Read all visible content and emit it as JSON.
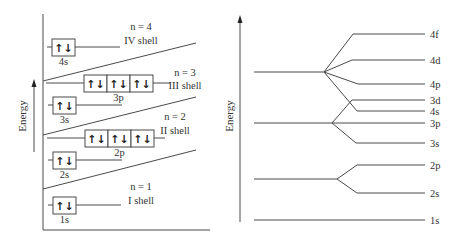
{
  "left_diagram": {
    "axis_label": "Energy",
    "shells": [
      {
        "n_label": "n = 4",
        "shell_label": "IV shell"
      },
      {
        "n_label": "n = 3",
        "shell_label": "III shell"
      },
      {
        "n_label": "n = 2",
        "shell_label": "II shell"
      },
      {
        "n_label": "n = 1",
        "shell_label": "I shell"
      }
    ],
    "orbitals": [
      {
        "label": "4s",
        "boxes": 1
      },
      {
        "label": "3p",
        "boxes": 3
      },
      {
        "label": "3s",
        "boxes": 1
      },
      {
        "label": "2p",
        "boxes": 3
      },
      {
        "label": "2s",
        "boxes": 1
      },
      {
        "label": "1s",
        "boxes": 1
      }
    ],
    "electron_pair_glyph": "↑↓"
  },
  "right_diagram": {
    "axis_label": "Energy",
    "levels": [
      "4f",
      "4d",
      "4p",
      "3d",
      "4s",
      "3p",
      "3s",
      "2p",
      "2s",
      "1s"
    ]
  }
}
